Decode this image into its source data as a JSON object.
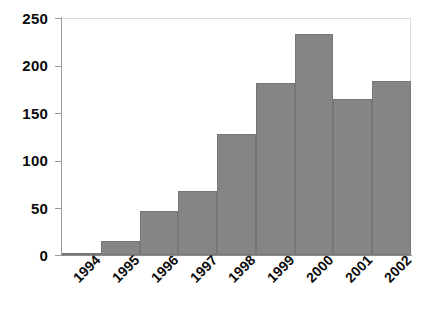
{
  "chart_data": {
    "type": "bar",
    "title": "",
    "subtitle": "",
    "xlabel": "",
    "ylabel": "",
    "categories": [
      "1994",
      "1995",
      "1996",
      "1997",
      "1998",
      "1999",
      "2000",
      "2001",
      "2002"
    ],
    "values": [
      2,
      15,
      46,
      68,
      128,
      181,
      233,
      165,
      184
    ],
    "series": [
      {
        "name": "count",
        "values": [
          2,
          15,
          46,
          68,
          128,
          181,
          233,
          165,
          184
        ]
      }
    ],
    "ylim": [
      0,
      250
    ],
    "yticks": [
      0,
      50,
      100,
      150,
      200,
      250
    ],
    "ytick_labels": [
      "0",
      "50",
      "100",
      "150",
      "200",
      "250"
    ],
    "grid": false,
    "legend": false,
    "legend_position": "none",
    "bar_color": "#858585",
    "bar_edge_color": "#767676",
    "axis_color": "#9a9a9a",
    "text_color": "#0b0b0b",
    "background": "#ffffff",
    "xtick_rotation": -45,
    "annotations": []
  }
}
